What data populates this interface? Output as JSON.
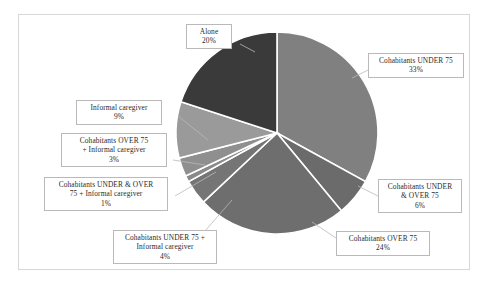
{
  "chart_data": {
    "type": "pie",
    "title": "",
    "subtitle": "",
    "xlabel": "",
    "ylabel": "",
    "legend_position": "none",
    "grid": false,
    "labels_show_percent": true,
    "start_angle_deg": 0,
    "direction": "clockwise",
    "categories": [
      "Cohabitants UNDER 75",
      "Cohabitants UNDER & OVER 75",
      "Cohabitants OVER 75",
      "Cohabitants UNDER 75 + Informal caregiver",
      "Cohabitants UNDER & OVER 75 + Informal caregiver",
      "Cohabitants OVER 75 + Informal caregiver",
      "Informal caregiver",
      "Alone"
    ],
    "values": [
      33,
      6,
      24,
      4,
      1,
      3,
      9,
      20
    ],
    "value_labels": [
      "33%",
      "6%",
      "24%",
      "4%",
      "1%",
      "3%",
      "9%",
      "20%"
    ],
    "colors": [
      "#808080",
      "#6b6b6b",
      "#6e6e6e",
      "#757575",
      "#8a8a8a",
      "#8f8f8f",
      "#9a9a9a",
      "#3a3a3a"
    ],
    "slice_border_color": "#ffffff"
  },
  "slices": [
    {
      "name": "cohabitants-under-75",
      "label": "Cohabitants UNDER  75",
      "percent": "33%",
      "value": 33,
      "color": "#808080"
    },
    {
      "name": "cohabitants-under-and-over-75",
      "label_line1": "Cohabitants UNDER",
      "label_line2": "& OVER 75",
      "percent": "6%",
      "value": 6,
      "color": "#6b6b6b"
    },
    {
      "name": "cohabitants-over-75",
      "label": "Cohabitants OVER 75",
      "percent": "24%",
      "value": 24,
      "color": "#6e6e6e"
    },
    {
      "name": "cohabitants-under-75-informal-caregiver",
      "label_line1": "Cohabitants UNDER 75 +",
      "label_line2": "Informal  caregiver",
      "percent": "4%",
      "value": 4,
      "color": "#757575"
    },
    {
      "name": "cohabitants-under-and-over-75-informal-caregiver",
      "label_line1": "Cohabitants UNDER  & OVER",
      "label_line2": "75 + Informal  caregiver",
      "percent": "1%",
      "value": 1,
      "color": "#8a8a8a"
    },
    {
      "name": "cohabitants-over-75-informal-caregiver",
      "label_line1": "Cohabitants OVER  75",
      "label_line2": "+ Informal  caregiver",
      "percent": "3%",
      "value": 3,
      "color": "#8f8f8f"
    },
    {
      "name": "informal-caregiver",
      "label": "Informal  caregiver",
      "percent": "9%",
      "value": 9,
      "color": "#9a9a9a"
    },
    {
      "name": "alone",
      "label": "Alone",
      "percent": "20%",
      "value": 20,
      "color": "#3a3a3a"
    }
  ],
  "frame": {
    "border_color": "#d8d8d8",
    "background": "#ffffff"
  }
}
